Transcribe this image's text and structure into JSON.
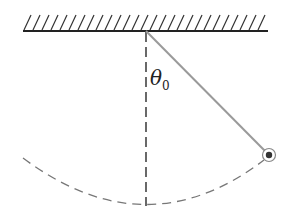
{
  "diagram": {
    "angle_label": "θ",
    "angle_subscript": "0",
    "colors": {
      "ceiling": "#222222",
      "string": "#9a9a9a",
      "dashed": "#444444",
      "arc": "#777777",
      "bob": "#333333"
    }
  }
}
